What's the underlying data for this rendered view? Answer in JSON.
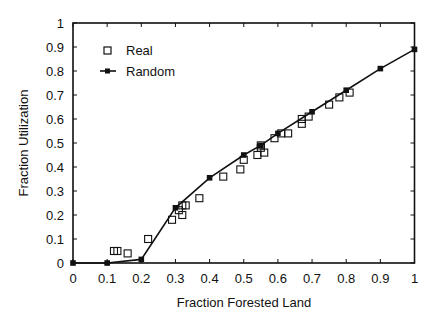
{
  "chart_data": {
    "type": "scatter",
    "title": "",
    "xlabel": "Fraction Forested Land",
    "ylabel": "Fraction Utilization",
    "xlim": [
      0,
      1
    ],
    "ylim": [
      0,
      1
    ],
    "xticks": [
      "0",
      "0.1",
      "0.2",
      "0.3",
      "0.4",
      "0.5",
      "0.6",
      "0.7",
      "0.8",
      "0.9",
      "1"
    ],
    "yticks": [
      "0",
      "0.1",
      "0.2",
      "0.3",
      "0.4",
      "0.5",
      "0.6",
      "0.7",
      "0.8",
      "0.9",
      "1"
    ],
    "grid": false,
    "legend_position": "upper-left",
    "series": [
      {
        "name": "Real",
        "style": "open-square-markers",
        "points": [
          [
            0.12,
            0.05
          ],
          [
            0.13,
            0.05
          ],
          [
            0.16,
            0.04
          ],
          [
            0.22,
            0.1
          ],
          [
            0.29,
            0.18
          ],
          [
            0.31,
            0.22
          ],
          [
            0.32,
            0.2
          ],
          [
            0.32,
            0.24
          ],
          [
            0.33,
            0.24
          ],
          [
            0.37,
            0.27
          ],
          [
            0.44,
            0.36
          ],
          [
            0.49,
            0.39
          ],
          [
            0.5,
            0.43
          ],
          [
            0.54,
            0.45
          ],
          [
            0.55,
            0.48
          ],
          [
            0.55,
            0.49
          ],
          [
            0.56,
            0.46
          ],
          [
            0.59,
            0.52
          ],
          [
            0.61,
            0.54
          ],
          [
            0.63,
            0.54
          ],
          [
            0.67,
            0.58
          ],
          [
            0.67,
            0.6
          ],
          [
            0.69,
            0.61
          ],
          [
            0.75,
            0.66
          ],
          [
            0.78,
            0.69
          ],
          [
            0.81,
            0.71
          ]
        ]
      },
      {
        "name": "Random",
        "style": "line-with-filled-square-markers",
        "points": [
          [
            0,
            0
          ],
          [
            0.1,
            0
          ],
          [
            0.2,
            0.015
          ],
          [
            0.3,
            0.23
          ],
          [
            0.4,
            0.355
          ],
          [
            0.5,
            0.45
          ],
          [
            0.55,
            0.49
          ],
          [
            0.6,
            0.54
          ],
          [
            0.7,
            0.63
          ],
          [
            0.8,
            0.72
          ],
          [
            0.9,
            0.81
          ],
          [
            1.0,
            0.89
          ]
        ]
      }
    ]
  },
  "legend": {
    "real_label": "Real",
    "random_label": "Random"
  },
  "axes": {
    "xlabel": "Fraction Forested Land",
    "ylabel": "Fraction Utilization"
  }
}
